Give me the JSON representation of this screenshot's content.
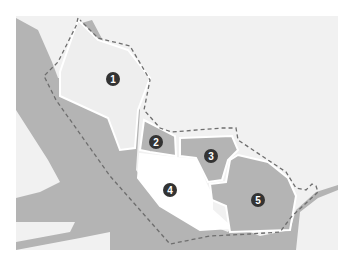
{
  "map": {
    "colors": {
      "page_background": "#ffffff",
      "map_background": "#f1f1f1",
      "dark_area": "#b4b4b4",
      "zone_light": "#eeeeee",
      "zone_medium": "#b4b4b4",
      "zone_white": "#ffffff",
      "border_line": "#6e6e6e",
      "marker_fill": "#333333",
      "marker_text": "#ffffff"
    },
    "boundary_style": "dashed",
    "zones": [
      {
        "id": 1,
        "label": "1",
        "fill": "light"
      },
      {
        "id": 2,
        "label": "2",
        "fill": "medium"
      },
      {
        "id": 3,
        "label": "3",
        "fill": "medium"
      },
      {
        "id": 4,
        "label": "4",
        "fill": "white"
      },
      {
        "id": 5,
        "label": "5",
        "fill": "medium"
      }
    ]
  }
}
